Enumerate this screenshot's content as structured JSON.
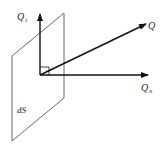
{
  "diagram": {
    "type": "vector-decomposition",
    "surface_label": "dS",
    "vectors": [
      {
        "id": "Qt",
        "label_main": "Q",
        "label_sub": "t",
        "direction": "tangential (up)"
      },
      {
        "id": "Q",
        "label_main": "Q",
        "label_sub": "",
        "direction": "oblique"
      },
      {
        "id": "Qn",
        "label_main": "Q",
        "label_sub": "n",
        "direction": "normal (right)"
      }
    ],
    "right_angle_marker": true,
    "colors": {
      "stroke": "#111111",
      "plane": "#444444",
      "background": "#ffffff"
    }
  }
}
